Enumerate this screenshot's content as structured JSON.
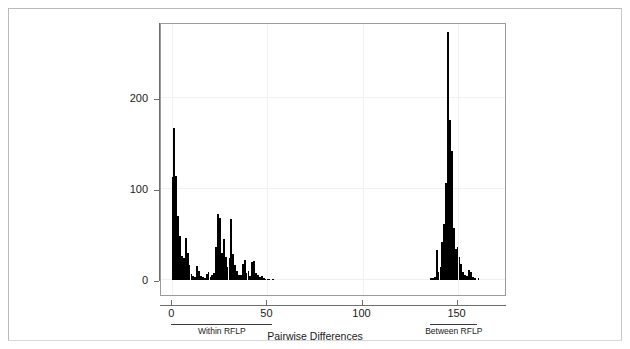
{
  "chart_data": {
    "type": "bar",
    "title": "",
    "subtitle": "",
    "xlabel": "Pairwise Differences",
    "ylabel": "",
    "xlim": [
      -6,
      176
    ],
    "ylim": [
      0,
      283
    ],
    "grid": true,
    "legend": null,
    "bin_width": 1,
    "x_ticks": [
      0,
      50,
      100,
      150
    ],
    "x_tick_labels": [
      "0",
      "50",
      "100",
      "150"
    ],
    "y_ticks": [
      0,
      100,
      200
    ],
    "y_tick_labels": [
      "0",
      "100",
      "200"
    ],
    "annotations": [
      {
        "label": "Within RFLP",
        "x_start": 0,
        "x_end": 53,
        "position": "below-axis"
      },
      {
        "label": "Between RFLP",
        "x_start": 136,
        "x_end": 161,
        "position": "below-axis"
      }
    ],
    "series": [
      {
        "name": "Pairwise differences",
        "color": "#000000",
        "x": [
          0,
          1,
          2,
          3,
          4,
          5,
          6,
          7,
          8,
          9,
          10,
          11,
          12,
          13,
          14,
          15,
          16,
          17,
          18,
          19,
          20,
          21,
          22,
          23,
          24,
          25,
          26,
          27,
          28,
          29,
          30,
          31,
          32,
          33,
          34,
          35,
          36,
          37,
          38,
          39,
          40,
          41,
          42,
          43,
          44,
          45,
          46,
          47,
          48,
          49,
          50,
          51,
          52,
          53,
          136,
          137,
          138,
          139,
          140,
          141,
          142,
          143,
          144,
          145,
          146,
          147,
          148,
          149,
          150,
          151,
          152,
          153,
          154,
          155,
          156,
          157,
          158,
          159,
          160,
          161
        ],
        "values": [
          113,
          167,
          114,
          70,
          48,
          26,
          24,
          46,
          30,
          17,
          7,
          4,
          3,
          15,
          10,
          4,
          3,
          2,
          7,
          9,
          3,
          5,
          8,
          36,
          72,
          68,
          30,
          45,
          25,
          14,
          24,
          67,
          29,
          17,
          10,
          6,
          5,
          18,
          22,
          8,
          10,
          4,
          20,
          21,
          8,
          6,
          3,
          4,
          2,
          1,
          1,
          1,
          0,
          1,
          2,
          2,
          3,
          33,
          9,
          14,
          42,
          61,
          106,
          272,
          175,
          141,
          57,
          34,
          36,
          25,
          18,
          9,
          5,
          4,
          11,
          9,
          3,
          2,
          0,
          2
        ]
      }
    ]
  },
  "axes": {
    "y_labels": [
      "200",
      "100",
      "0"
    ],
    "x_labels": [
      "0",
      "50",
      "100",
      "150"
    ]
  },
  "groups": [
    {
      "label": "Within RFLP"
    },
    {
      "label": "Between RFLP"
    }
  ],
  "titles": {
    "x_axis": "Pairwise Differences"
  }
}
